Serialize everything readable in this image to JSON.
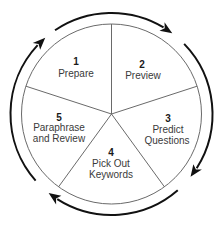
{
  "diagram": {
    "type": "cycle",
    "direction": "clockwise",
    "segment_count": 5,
    "colors": {
      "circle_stroke": "#6a6a6a",
      "arrow": "#111111",
      "text": "#3a3a3a",
      "background": "#ffffff"
    },
    "segments": [
      {
        "number": "1",
        "lines": [
          "Prepare"
        ]
      },
      {
        "number": "2",
        "lines": [
          "Preview"
        ]
      },
      {
        "number": "3",
        "lines": [
          "Predict",
          "Questions"
        ]
      },
      {
        "number": "4",
        "lines": [
          "Pick Out",
          "Keywords"
        ]
      },
      {
        "number": "5",
        "lines": [
          "Paraphrase",
          "and Review"
        ]
      }
    ],
    "cycle_arrows": [
      {
        "name": "arrow-left",
        "icon": "curved-arrow-clockwise-icon"
      },
      {
        "name": "arrow-top",
        "icon": "curved-arrow-clockwise-icon"
      },
      {
        "name": "arrow-right",
        "icon": "curved-arrow-clockwise-icon"
      },
      {
        "name": "arrow-bottom",
        "icon": "curved-arrow-clockwise-icon"
      }
    ]
  }
}
